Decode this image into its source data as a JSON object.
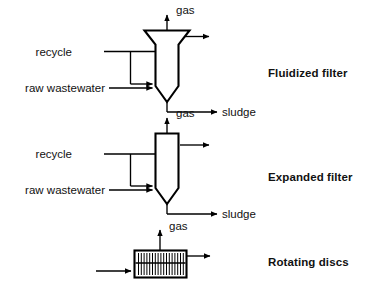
{
  "figure": {
    "type": "process-flow-diagram",
    "background_color": "#ffffff",
    "line_color": "#000000",
    "media_color": "#9a9a9a"
  },
  "units": [
    {
      "id": "fluidized-filter",
      "process_label": "Fluidized filter",
      "vessel_shape": "flared-top column with conical bottom, fully packed media",
      "inlets": [
        {
          "name": "recycle",
          "label": "recycle"
        },
        {
          "name": "raw-wastewater",
          "label": "raw wastewater"
        }
      ],
      "outlets": [
        {
          "name": "gas",
          "label": "gas",
          "direction": "up"
        },
        {
          "name": "effluent",
          "label": "",
          "direction": "right"
        },
        {
          "name": "sludge",
          "label": "sludge",
          "direction": "down-right"
        }
      ]
    },
    {
      "id": "expanded-filter",
      "process_label": "Expanded filter",
      "vessel_shape": "straight column with conical bottom, media in lower section",
      "inlets": [
        {
          "name": "recycle",
          "label": "recycle"
        },
        {
          "name": "raw-wastewater",
          "label": "raw wastewater"
        }
      ],
      "outlets": [
        {
          "name": "gas",
          "label": "gas",
          "direction": "up"
        },
        {
          "name": "effluent",
          "label": "",
          "direction": "right"
        },
        {
          "name": "sludge",
          "label": "sludge",
          "direction": "down-right"
        }
      ]
    },
    {
      "id": "rotating-discs",
      "process_label": "Rotating discs",
      "vessel_shape": "rectangular tank with horizontal shaft and vertical discs",
      "disc_count": 17,
      "inlets": [
        {
          "name": "influent",
          "label": "",
          "direction": "right"
        }
      ],
      "outlets": [
        {
          "name": "gas",
          "label": "gas",
          "direction": "up"
        },
        {
          "name": "effluent",
          "label": "",
          "direction": "right"
        }
      ]
    }
  ],
  "labels": {
    "gas": "gas",
    "sludge": "sludge",
    "recycle": "recycle",
    "raw_wastewater": "raw wastewater",
    "fluidized_filter": "Fluidized filter",
    "expanded_filter": "Expanded filter",
    "rotating_discs": "Rotating discs"
  }
}
